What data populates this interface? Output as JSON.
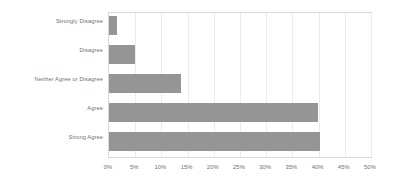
{
  "chart_data": {
    "type": "bar",
    "orientation": "horizontal",
    "title": "",
    "subtitle": "",
    "xlabel": "",
    "ylabel": "",
    "categories": [
      "Strongly Disagree",
      "Disagree",
      "Neither Agree or Disagree",
      "Agree",
      "Strong Agree"
    ],
    "values": [
      1.5,
      5,
      13.8,
      39.8,
      40.2
    ],
    "value_suffix": "%",
    "xlim": [
      0,
      50
    ],
    "xticks": [
      0,
      5,
      10,
      15,
      20,
      25,
      30,
      35,
      40,
      45,
      50
    ],
    "xtick_labels": [
      "0%",
      "5%",
      "10%",
      "15%",
      "20%",
      "25%",
      "30%",
      "35%",
      "40%",
      "45%",
      "50%"
    ],
    "grid": true,
    "grid_axis": "x",
    "legend": false,
    "series": [
      {
        "name": "Response share",
        "color": "#959595",
        "values": [
          1.5,
          5,
          13.8,
          39.8,
          40.2
        ]
      }
    ],
    "colors": {
      "bar": "#959595",
      "gridline": "#ececec",
      "plot_border": "#d9d9d9",
      "text": "#6e6e6e",
      "background": "#ffffff"
    }
  }
}
